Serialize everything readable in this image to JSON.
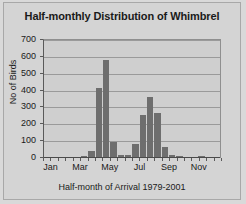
{
  "chart_data": {
    "type": "bar",
    "title": "Half-monthly Distribution of Whimbrel",
    "xlabel": "Half-month of Arrival 1979-2001",
    "ylabel": "No of Birds",
    "ylim": [
      0,
      700
    ],
    "ytick_values": [
      0,
      100,
      200,
      300,
      400,
      500,
      600,
      700
    ],
    "ytick_labels": [
      "0",
      "100",
      "200",
      "300",
      "400",
      "500",
      "600",
      "700"
    ],
    "grid": true,
    "legend": "none",
    "bar_color": "#6e6e6e",
    "plot_background": "#cfcfcf",
    "figure_background": "#d4d4d4",
    "categories": [
      "Jan 1",
      "Jan 2",
      "Feb 1",
      "Feb 2",
      "Mar 1",
      "Mar 2",
      "Apr 1",
      "Apr 2",
      "May 1",
      "May 2",
      "Jun 1",
      "Jun 2",
      "Jul 1",
      "Jul 2",
      "Aug 1",
      "Aug 2",
      "Sep 1",
      "Sep 2",
      "Oct 1",
      "Oct 2",
      "Nov 1",
      "Nov 2",
      "Dec 1",
      "Dec 2"
    ],
    "values": [
      0,
      0,
      0,
      0,
      0,
      8,
      35,
      410,
      575,
      90,
      12,
      12,
      78,
      252,
      355,
      260,
      58,
      10,
      8,
      0,
      0,
      6,
      0,
      0
    ],
    "xtick_labels": [
      "Jan",
      "Mar",
      "May",
      "Jul",
      "Sep",
      "Nov"
    ],
    "xtick_categories": [
      "Jan 1",
      "Mar 1",
      "May 1",
      "Jul 1",
      "Sep 1",
      "Nov 1"
    ]
  }
}
